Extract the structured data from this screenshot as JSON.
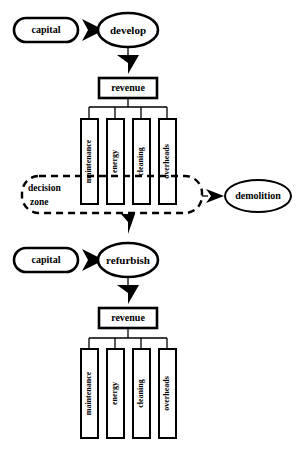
{
  "diagram": {
    "background_color": "#ffffff",
    "line_color": "#000000",
    "sections": {
      "develop": {
        "input_label": "capital",
        "stage_label": "develop",
        "output_label": "revenue",
        "cost_labels": [
          "maintenance",
          "energy",
          "cleaning",
          "overheads"
        ]
      },
      "refurbish": {
        "input_label": "capital",
        "stage_label": "refurbish",
        "output_label": "revenue",
        "cost_labels": [
          "maintenance",
          "energy",
          "cleaning",
          "overheads"
        ]
      }
    },
    "decision_zone": {
      "label_line1": "decision",
      "label_line2": "zone",
      "style": "dashed-rounded-rectangle"
    },
    "terminal": {
      "label": "demolition",
      "shape": "ellipse"
    },
    "icons": {
      "flow_arrow": "triangle-right-arrow-icon",
      "down_arrow": "triangle-down-arrow-icon"
    }
  }
}
